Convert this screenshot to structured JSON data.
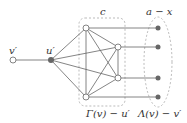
{
  "labels": {
    "v_prime": "v′",
    "u_prime": "u′",
    "clique_size": "c",
    "right_count": "a − x",
    "gamma_label": "Γ(v) − u′",
    "lambda_label": "Λ(v) − v′"
  },
  "colors": {
    "edge": "#666666",
    "node_fill": "#666666",
    "open_node": "#ffffff",
    "dashed": "#aaaaaa"
  }
}
